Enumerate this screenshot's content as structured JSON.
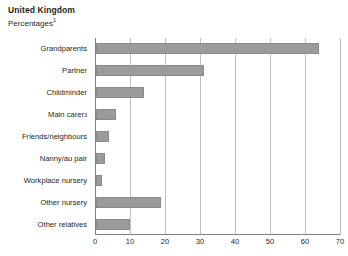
{
  "chart_data": {
    "type": "bar",
    "orientation": "horizontal",
    "title": "United Kingdom",
    "subtitle": "Percentages",
    "subtitle_footnote": "1",
    "xlabel": "",
    "ylabel": "",
    "xlim": [
      0,
      70
    ],
    "xticks": [
      0,
      10,
      20,
      30,
      40,
      50,
      60,
      70
    ],
    "grid": "vertical",
    "legend": "none",
    "bar_color": "#9b9b9b",
    "bar_border_color": "#8a8a8a",
    "categories": [
      "Grandparents",
      "Partner",
      "Childminder",
      "Main carer",
      "Friends/neighbours",
      "Nanny/au pair",
      "Workplace nursery",
      "Other nursery",
      "Other relatives"
    ],
    "category_footnotes": [
      "",
      "",
      "",
      "3",
      "",
      "",
      "",
      "",
      ""
    ],
    "values": [
      64,
      31,
      14,
      6,
      4,
      3,
      2,
      19,
      10
    ]
  },
  "xtick_labels": [
    "0",
    "10",
    "20",
    "30",
    "40",
    "50",
    "60",
    "70"
  ]
}
